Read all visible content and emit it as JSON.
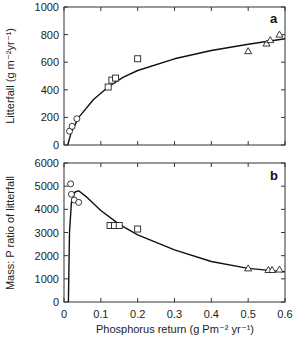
{
  "chart_data": [
    {
      "type": "scatter",
      "panel": "a",
      "title": "",
      "xlabel": "Phosphorus return (g Pm-2 yr-1)",
      "ylabel": "Litterfall (g m-2 yr-1)",
      "xlim": [
        0,
        0.6
      ],
      "ylim": [
        0,
        1000
      ],
      "x_ticks": [
        "0",
        "0.1",
        "0.2",
        "0.3",
        "0.4",
        "0.5",
        "0.6"
      ],
      "y_ticks": [
        "0",
        "200",
        "400",
        "600",
        "800",
        "1000"
      ],
      "grid": false,
      "series": [
        {
          "name": "circles",
          "marker": "circle",
          "x": [
            0.015,
            0.022,
            0.035
          ],
          "y": [
            100,
            135,
            190
          ]
        },
        {
          "name": "squares",
          "marker": "square",
          "x": [
            0.12,
            0.13,
            0.14,
            0.2
          ],
          "y": [
            420,
            470,
            485,
            625
          ]
        },
        {
          "name": "triangles",
          "marker": "triangle",
          "x": [
            0.5,
            0.55,
            0.56,
            0.585
          ],
          "y": [
            680,
            735,
            760,
            800
          ]
        },
        {
          "name": "fit",
          "marker": "line",
          "x": [
            0.01,
            0.02,
            0.04,
            0.08,
            0.12,
            0.16,
            0.2,
            0.3,
            0.4,
            0.5,
            0.6
          ],
          "y": [
            0,
            95,
            200,
            330,
            420,
            490,
            540,
            625,
            685,
            730,
            770
          ]
        }
      ]
    },
    {
      "type": "scatter",
      "panel": "b",
      "title": "",
      "xlabel": "Phosphorus return (g Pm-2 yr-1)",
      "ylabel": "Mass: P ratio of litterfall",
      "xlim": [
        0,
        0.6
      ],
      "ylim": [
        0,
        6000
      ],
      "x_ticks": [
        "0",
        "0.1",
        "0.2",
        "0.3",
        "0.4",
        "0.5",
        "0.6"
      ],
      "y_ticks": [
        "0",
        "1000",
        "2000",
        "3000",
        "4000",
        "5000",
        "6000"
      ],
      "grid": false,
      "series": [
        {
          "name": "circles",
          "marker": "circle",
          "x": [
            0.018,
            0.02,
            0.028,
            0.04
          ],
          "y": [
            5100,
            4650,
            4400,
            4300
          ]
        },
        {
          "name": "squares",
          "marker": "square",
          "x": [
            0.125,
            0.137,
            0.15,
            0.2
          ],
          "y": [
            3300,
            3300,
            3300,
            3150
          ]
        },
        {
          "name": "triangles",
          "marker": "triangle",
          "x": [
            0.5,
            0.555,
            0.565,
            0.585
          ],
          "y": [
            1450,
            1380,
            1380,
            1400
          ]
        },
        {
          "name": "fit",
          "marker": "line",
          "x": [
            0.012,
            0.015,
            0.02,
            0.03,
            0.04,
            0.06,
            0.1,
            0.15,
            0.2,
            0.3,
            0.4,
            0.5,
            0.6
          ],
          "y": [
            0,
            3000,
            4300,
            4750,
            4800,
            4550,
            3950,
            3350,
            2900,
            2250,
            1750,
            1450,
            1300
          ]
        }
      ]
    }
  ],
  "labels": {
    "panel_a": "a",
    "panel_b": "b",
    "ylabel_a": "Litterfall (g m⁻²yr⁻¹)",
    "ylabel_b": "Mass: P ratio of litterfall",
    "xlabel": "Phosphorus return (g Pm⁻² yr⁻¹)"
  }
}
